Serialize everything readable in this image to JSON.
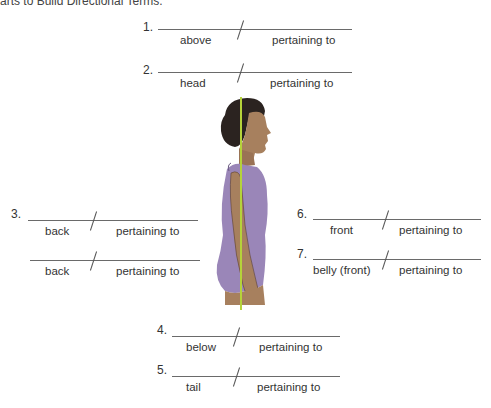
{
  "header": {
    "text": "arts to Build Directional Terms."
  },
  "items": [
    {
      "number": "1.",
      "left_label": "above",
      "right_label": "pertaining to"
    },
    {
      "number": "2.",
      "left_label": "head",
      "right_label": "pertaining to"
    },
    {
      "number": "3.",
      "left_label": "back",
      "right_label": "pertaining to"
    },
    {
      "number": "",
      "left_label": "back",
      "right_label": "pertaining to"
    },
    {
      "number": "4.",
      "left_label": "below",
      "right_label": "pertaining to"
    },
    {
      "number": "5.",
      "left_label": "tail",
      "right_label": "pertaining to"
    },
    {
      "number": "6.",
      "left_label": "front",
      "right_label": "pertaining to"
    },
    {
      "number": "7.",
      "left_label": "belly (front)",
      "right_label": "pertaining to"
    }
  ],
  "figure": {
    "line_color": "#b5d33a",
    "suit_color": "#9a86b8",
    "skin_color": "#a7805e",
    "hair_color": "#2b2320"
  }
}
